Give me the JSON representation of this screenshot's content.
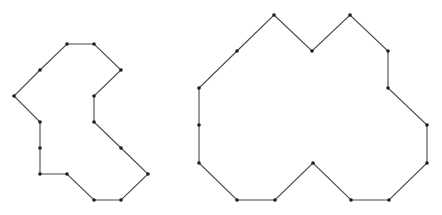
{
  "diagram": {
    "width": 442,
    "height": 215,
    "background": "#ffffff",
    "edge_color": "#4a4a4a",
    "vertex_color": "#1e1e1e",
    "vertex_radius": 1.8,
    "polygons": [
      {
        "name": "left-polygon",
        "vertices": [
          [
            67,
            44
          ],
          [
            94,
            44
          ],
          [
            121,
            70
          ],
          [
            94,
            96
          ],
          [
            94,
            122
          ],
          [
            121,
            148
          ],
          [
            148,
            174
          ],
          [
            121,
            200
          ],
          [
            94,
            200
          ],
          [
            67,
            174
          ],
          [
            40,
            174
          ],
          [
            40,
            148
          ],
          [
            40,
            122
          ],
          [
            14,
            96
          ],
          [
            40,
            70
          ]
        ]
      },
      {
        "name": "right-polygon",
        "vertices": [
          [
            274,
            15
          ],
          [
            312,
            51
          ],
          [
            350,
            15
          ],
          [
            388,
            51
          ],
          [
            388,
            88
          ],
          [
            427,
            125
          ],
          [
            427,
            163
          ],
          [
            389,
            200
          ],
          [
            351,
            200
          ],
          [
            313,
            163
          ],
          [
            275,
            200
          ],
          [
            237,
            200
          ],
          [
            199,
            163
          ],
          [
            199,
            125
          ],
          [
            199,
            88
          ],
          [
            237,
            51
          ]
        ]
      }
    ]
  }
}
